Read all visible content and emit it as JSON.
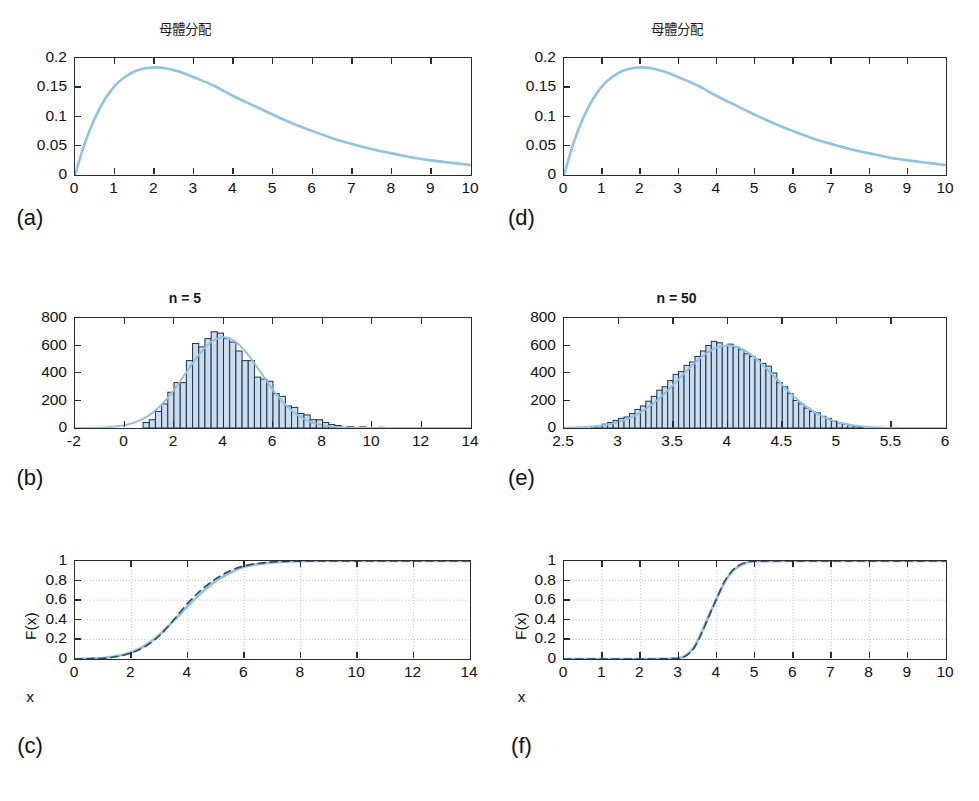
{
  "figure": {
    "background": "#ffffff",
    "accent_curve_color": "#8fc2e3",
    "bar_fill_color": "#cadced",
    "bar_edge_color": "#1f3347",
    "axis_color": "#2b2b2b",
    "grid_color": "#c8c8c8"
  },
  "panels": {
    "a": {
      "tag": "(a)",
      "title": "母體分配",
      "xticks": [
        "0",
        "1",
        "2",
        "3",
        "4",
        "5",
        "6",
        "7",
        "8",
        "9",
        "10"
      ],
      "yticks": [
        "0",
        "0.05",
        "0.1",
        "0.15",
        "0.2"
      ]
    },
    "b": {
      "tag": "(b)",
      "title": "n = 5",
      "xticks": [
        "-2",
        "0",
        "2",
        "4",
        "6",
        "8",
        "10",
        "12",
        "14"
      ],
      "yticks": [
        "0",
        "200",
        "400",
        "600",
        "800"
      ]
    },
    "c": {
      "tag": "(c)",
      "title": "",
      "xlabel": "x",
      "ylabel": "F(x)",
      "xticks": [
        "0",
        "2",
        "4",
        "6",
        "8",
        "10",
        "12",
        "14"
      ],
      "yticks": [
        "0",
        "0.2",
        "0.4",
        "0.6",
        "0.8",
        "1"
      ]
    },
    "d": {
      "tag": "(d)",
      "title": "母體分配",
      "xticks": [
        "0",
        "1",
        "2",
        "3",
        "4",
        "5",
        "6",
        "7",
        "8",
        "9",
        "10"
      ],
      "yticks": [
        "0",
        "0.05",
        "0.1",
        "0.15",
        "0.2"
      ]
    },
    "e": {
      "tag": "(e)",
      "title": "n = 50",
      "xticks": [
        "2.5",
        "3",
        "3.5",
        "4",
        "4.5",
        "5",
        "5.5",
        "6"
      ],
      "yticks": [
        "0",
        "200",
        "400",
        "600",
        "800"
      ]
    },
    "f": {
      "tag": "(f)",
      "title": "",
      "xlabel": "x",
      "ylabel": "F(x)",
      "xticks": [
        "0",
        "1",
        "2",
        "3",
        "4",
        "5",
        "6",
        "7",
        "8",
        "9",
        "10"
      ],
      "yticks": [
        "0",
        "0.2",
        "0.4",
        "0.6",
        "0.8",
        "1"
      ]
    }
  },
  "chart_data": [
    {
      "id": "a",
      "type": "line",
      "title": "母體分配",
      "subplot_label": "(a)",
      "xlabel": "",
      "ylabel": "",
      "xlim": [
        0,
        10
      ],
      "ylim": [
        0,
        0.2
      ],
      "xticks": [
        0,
        1,
        2,
        3,
        4,
        5,
        6,
        7,
        8,
        9,
        10
      ],
      "yticks": [
        0,
        0.05,
        0.1,
        0.15,
        0.2
      ],
      "grid": false,
      "legend": null,
      "series": [
        {
          "name": "population pdf (gamma k=2, theta=2 / chi-square df=4)",
          "color": "#8fc2e3",
          "style": "solid",
          "x": [
            0,
            0.25,
            0.5,
            0.75,
            1,
            1.25,
            1.5,
            1.75,
            2,
            2.25,
            2.5,
            2.75,
            3,
            3.5,
            4,
            4.5,
            5,
            5.5,
            6,
            6.5,
            7,
            7.5,
            8,
            8.5,
            9,
            9.5,
            10
          ],
          "y": [
            0.0,
            0.055,
            0.097,
            0.129,
            0.152,
            0.167,
            0.177,
            0.182,
            0.184,
            0.183,
            0.179,
            0.174,
            0.167,
            0.153,
            0.135,
            0.119,
            0.103,
            0.088,
            0.075,
            0.063,
            0.053,
            0.044,
            0.037,
            0.03,
            0.025,
            0.021,
            0.017
          ]
        }
      ]
    },
    {
      "id": "b",
      "type": "bar",
      "title": "n = 5",
      "subplot_label": "(b)",
      "xlabel": "",
      "ylabel": "",
      "xlim": [
        -2,
        14
      ],
      "ylim": [
        0,
        800
      ],
      "xticks": [
        -2,
        0,
        2,
        4,
        6,
        8,
        10,
        12,
        14
      ],
      "yticks": [
        0,
        200,
        400,
        600,
        800
      ],
      "grid": false,
      "bin_width": 0.25,
      "bin_centers": [
        0.875,
        1.125,
        1.375,
        1.625,
        1.875,
        2.125,
        2.375,
        2.625,
        2.875,
        3.125,
        3.375,
        3.625,
        3.875,
        4.125,
        4.375,
        4.625,
        4.875,
        5.125,
        5.375,
        5.625,
        5.875,
        6.125,
        6.375,
        6.625,
        6.875,
        7.125,
        7.375,
        7.625,
        7.875,
        8.125,
        8.375,
        8.625,
        9.125,
        9.625,
        10.375
      ],
      "values": [
        40,
        60,
        120,
        175,
        260,
        330,
        330,
        490,
        615,
        590,
        650,
        700,
        690,
        650,
        625,
        560,
        490,
        490,
        370,
        355,
        340,
        250,
        230,
        160,
        150,
        105,
        95,
        60,
        60,
        40,
        25,
        18,
        10,
        8,
        5
      ],
      "overlay_curve": {
        "name": "normal approximation",
        "color": "#8fc2e3",
        "style": "solid",
        "mean": 4.0,
        "peak": 660
      }
    },
    {
      "id": "c",
      "type": "line",
      "title": "",
      "subplot_label": "(c)",
      "xlabel": "x",
      "ylabel": "F(x)",
      "xlim": [
        0,
        14
      ],
      "ylim": [
        0,
        1
      ],
      "xticks": [
        0,
        2,
        4,
        6,
        8,
        10,
        12,
        14
      ],
      "yticks": [
        0,
        0.2,
        0.4,
        0.6,
        0.8,
        1
      ],
      "grid": true,
      "series": [
        {
          "name": "empirical CDF of sample mean (n=5)",
          "color": "#8fc2e3",
          "style": "solid",
          "x": [
            0,
            0.5,
            1,
            1.5,
            2,
            2.5,
            3,
            3.5,
            4,
            4.5,
            5,
            5.5,
            6,
            6.5,
            7,
            7.5,
            8,
            9,
            10,
            11,
            12,
            13,
            14
          ],
          "y": [
            0.0,
            0.005,
            0.01,
            0.03,
            0.07,
            0.14,
            0.25,
            0.39,
            0.54,
            0.68,
            0.8,
            0.88,
            0.94,
            0.97,
            0.985,
            0.995,
            0.999,
            1.0,
            1.0,
            1.0,
            1.0,
            1.0,
            1.0
          ]
        },
        {
          "name": "theoretical normal CDF",
          "color": "#2f4a63",
          "style": "dashed",
          "x": [
            0,
            0.5,
            1,
            1.5,
            2,
            2.5,
            3,
            3.5,
            4,
            4.5,
            5,
            5.5,
            6,
            6.5,
            7,
            7.5,
            8,
            9,
            10,
            11,
            12,
            13,
            14
          ],
          "y": [
            0.0,
            0.003,
            0.008,
            0.025,
            0.062,
            0.13,
            0.24,
            0.4,
            0.57,
            0.71,
            0.82,
            0.9,
            0.95,
            0.975,
            0.99,
            0.996,
            0.999,
            1.0,
            1.0,
            1.0,
            1.0,
            1.0,
            1.0
          ]
        }
      ]
    },
    {
      "id": "d",
      "type": "line",
      "title": "母體分配",
      "subplot_label": "(d)",
      "xlabel": "",
      "ylabel": "",
      "xlim": [
        0,
        10
      ],
      "ylim": [
        0,
        0.2
      ],
      "xticks": [
        0,
        1,
        2,
        3,
        4,
        5,
        6,
        7,
        8,
        9,
        10
      ],
      "yticks": [
        0,
        0.05,
        0.1,
        0.15,
        0.2
      ],
      "grid": false,
      "series": [
        {
          "name": "population pdf (gamma k=2, theta=2 / chi-square df=4)",
          "color": "#8fc2e3",
          "style": "solid",
          "x": [
            0,
            0.25,
            0.5,
            0.75,
            1,
            1.25,
            1.5,
            1.75,
            2,
            2.25,
            2.5,
            2.75,
            3,
            3.5,
            4,
            4.5,
            5,
            5.5,
            6,
            6.5,
            7,
            7.5,
            8,
            8.5,
            9,
            9.5,
            10
          ],
          "y": [
            0.0,
            0.055,
            0.097,
            0.129,
            0.152,
            0.167,
            0.177,
            0.182,
            0.184,
            0.183,
            0.179,
            0.174,
            0.167,
            0.153,
            0.135,
            0.119,
            0.103,
            0.088,
            0.075,
            0.063,
            0.053,
            0.044,
            0.037,
            0.03,
            0.025,
            0.021,
            0.017
          ]
        }
      ]
    },
    {
      "id": "e",
      "type": "bar",
      "title": "n = 50",
      "subplot_label": "(e)",
      "xlabel": "",
      "ylabel": "",
      "xlim": [
        2.5,
        6
      ],
      "ylim": [
        0,
        800
      ],
      "xticks": [
        2.5,
        3,
        3.5,
        4,
        4.5,
        5,
        5.5,
        6
      ],
      "yticks": [
        0,
        200,
        400,
        600,
        800
      ],
      "grid": false,
      "bin_width": 0.05,
      "bin_centers": [
        2.775,
        2.825,
        2.875,
        2.925,
        2.975,
        3.025,
        3.075,
        3.125,
        3.175,
        3.225,
        3.275,
        3.325,
        3.375,
        3.425,
        3.475,
        3.525,
        3.575,
        3.625,
        3.675,
        3.725,
        3.775,
        3.825,
        3.875,
        3.925,
        3.975,
        4.025,
        4.075,
        4.125,
        4.175,
        4.225,
        4.275,
        4.325,
        4.375,
        4.425,
        4.475,
        4.525,
        4.575,
        4.625,
        4.675,
        4.725,
        4.775,
        4.825,
        4.875,
        4.925,
        4.975,
        5.025,
        5.075,
        5.125,
        5.175,
        5.225
      ],
      "values": [
        10,
        18,
        28,
        40,
        55,
        70,
        80,
        105,
        135,
        160,
        195,
        230,
        275,
        300,
        345,
        390,
        410,
        455,
        480,
        520,
        560,
        600,
        630,
        620,
        600,
        610,
        590,
        570,
        540,
        520,
        500,
        470,
        450,
        400,
        330,
        300,
        250,
        200,
        175,
        145,
        120,
        110,
        85,
        70,
        50,
        38,
        28,
        20,
        14,
        8
      ],
      "overlay_curve": {
        "name": "normal approximation",
        "color": "#8fc2e3",
        "style": "solid",
        "mean": 4.0,
        "peak": 600
      }
    },
    {
      "id": "f",
      "type": "line",
      "title": "",
      "subplot_label": "(f)",
      "xlabel": "x",
      "ylabel": "F(x)",
      "xlim": [
        0,
        10
      ],
      "ylim": [
        0,
        1
      ],
      "xticks": [
        0,
        1,
        2,
        3,
        4,
        5,
        6,
        7,
        8,
        9,
        10
      ],
      "yticks": [
        0,
        0.2,
        0.4,
        0.6,
        0.8,
        1
      ],
      "grid": true,
      "series": [
        {
          "name": "empirical CDF of sample mean (n=50)",
          "color": "#8fc2e3",
          "style": "solid",
          "x": [
            0,
            1,
            2,
            2.5,
            3,
            3.2,
            3.4,
            3.6,
            3.8,
            4.0,
            4.2,
            4.4,
            4.6,
            4.8,
            5,
            6,
            7,
            8,
            9,
            10
          ],
          "y": [
            0.0,
            0.0,
            0.0,
            0.002,
            0.01,
            0.04,
            0.12,
            0.27,
            0.45,
            0.62,
            0.78,
            0.89,
            0.95,
            0.985,
            0.997,
            1.0,
            1.0,
            1.0,
            1.0,
            1.0
          ]
        },
        {
          "name": "theoretical normal CDF",
          "color": "#2f4a63",
          "style": "dashed",
          "x": [
            0,
            1,
            2,
            2.5,
            3,
            3.2,
            3.4,
            3.6,
            3.8,
            4.0,
            4.2,
            4.4,
            4.6,
            4.8,
            5,
            6,
            7,
            8,
            9,
            10
          ],
          "y": [
            0.0,
            0.0,
            0.0,
            0.001,
            0.008,
            0.035,
            0.11,
            0.26,
            0.44,
            0.62,
            0.79,
            0.9,
            0.96,
            0.99,
            0.998,
            1.0,
            1.0,
            1.0,
            1.0,
            1.0
          ]
        }
      ]
    }
  ]
}
